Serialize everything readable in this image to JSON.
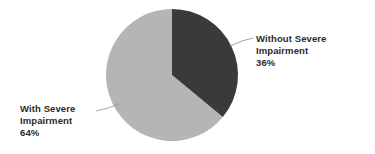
{
  "chart_data": {
    "type": "pie",
    "title": "",
    "subtitle": "",
    "xlabel": "",
    "ylabel": "",
    "legend_position": "none",
    "grid": false,
    "categories": [
      "Without Severe Impairment",
      "With Severe Impairment"
    ],
    "values": [
      36,
      64
    ],
    "value_unit": "%",
    "slices": [
      {
        "name": "Without Severe Impairment",
        "value": 36,
        "value_label": "36%",
        "color": "#3a3a3a",
        "start_angle_deg": 0,
        "end_angle_deg": 129.6,
        "label_lines": [
          "Without Severe",
          "Impairment",
          "36%"
        ]
      },
      {
        "name": "With Severe Impairment",
        "value": 64,
        "value_label": "64%",
        "color": "#b5b5b5",
        "start_angle_deg": 129.6,
        "end_angle_deg": 360,
        "label_lines": [
          "With Severe",
          "Impairment",
          "64%"
        ]
      }
    ],
    "start_angle_deg": 0,
    "direction": "clockwise",
    "background_color": "#ffffff",
    "label_text_color": "#2b2b2b",
    "leader_line_color": "#9a9a9a"
  },
  "labels": {
    "without_severe": {
      "line1": "Without Severe",
      "line2": "Impairment",
      "line3": "36%"
    },
    "with_severe": {
      "line1": "With Severe",
      "line2": "Impairment",
      "line3": "64%"
    }
  }
}
